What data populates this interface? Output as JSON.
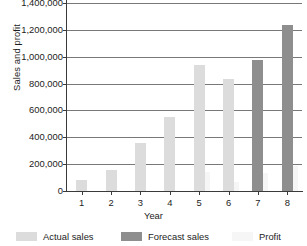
{
  "chart_data": {
    "type": "bar",
    "title": "",
    "xlabel": "Year",
    "ylabel": "Sales and profit",
    "categories": [
      "1",
      "2",
      "3",
      "4",
      "5",
      "6",
      "7",
      "8"
    ],
    "ylim": [
      0,
      1400000
    ],
    "ytick_labels": [
      "1,400,000",
      "1,200,000",
      "1,000,000",
      "800,000",
      "600,000",
      "400,000",
      "200,000",
      "0"
    ],
    "ytick_values": [
      1400000,
      1200000,
      1000000,
      800000,
      600000,
      400000,
      200000,
      0
    ],
    "grid": true,
    "legend_position": "bottom",
    "series": [
      {
        "name": "Actual sales",
        "color": "#dcdcdc",
        "values": [
          85000,
          160000,
          360000,
          550000,
          940000,
          835000,
          null,
          null
        ]
      },
      {
        "name": "Forecast sales",
        "color": "#8e8e8e",
        "values": [
          null,
          null,
          null,
          null,
          null,
          null,
          975000,
          1240000
        ]
      },
      {
        "name": "Profit",
        "color": "#f6f6f6",
        "values": [
          null,
          null,
          null,
          null,
          145000,
          70000,
          135000,
          190000
        ]
      }
    ]
  },
  "legend": {
    "items": [
      {
        "label": "Actual sales",
        "color": "#dcdcdc"
      },
      {
        "label": "Forecast sales",
        "color": "#8e8e8e"
      },
      {
        "label": "Profit",
        "color": "#f6f6f6"
      }
    ]
  }
}
